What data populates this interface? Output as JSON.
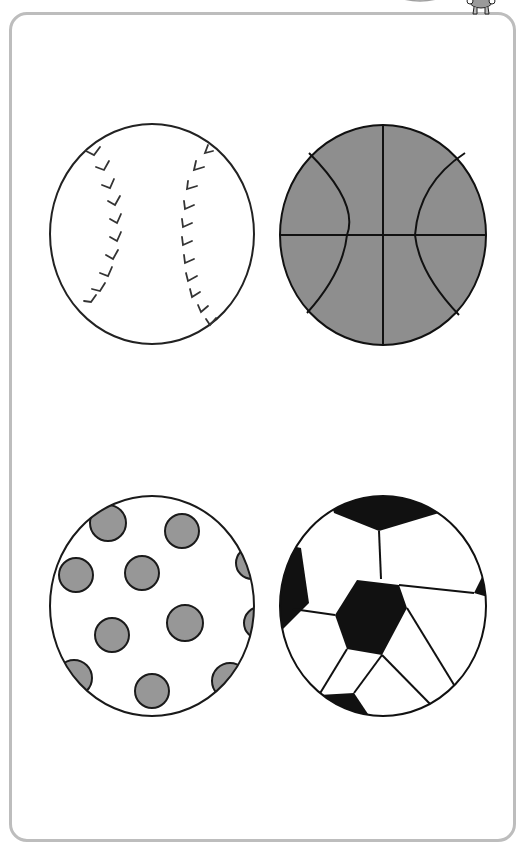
{
  "worksheet": {
    "frame_color": "#bdbdbd",
    "outline_color": "#1a1a1a",
    "fill_grey": "#8e8e8e",
    "balls": [
      {
        "name": "baseball",
        "position": "top-left",
        "fill": "#ffffff"
      },
      {
        "name": "basketball",
        "position": "top-right",
        "fill": "#8e8e8e"
      },
      {
        "name": "polka-dot-ball",
        "position": "bottom-left",
        "fill": "#ffffff",
        "dot_fill": "#979797",
        "dot_count": 11
      },
      {
        "name": "soccer-ball",
        "position": "bottom-right",
        "fill": "#ffffff",
        "patch_fill": "#111111"
      }
    ],
    "decorations": [
      {
        "name": "top-arc",
        "color": "#b0b0b0"
      },
      {
        "name": "mascot",
        "color": "#9a9a9a"
      }
    ]
  }
}
